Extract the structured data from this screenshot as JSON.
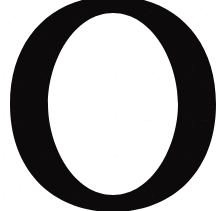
{
  "image": {
    "kind": "scanned-letterform",
    "description": "Large black serif capital letter O on white background",
    "width_px": 223,
    "height_px": 211,
    "background_color": "#ffffff",
    "ink_color": "#0c0a0a"
  },
  "glyph": {
    "character": "O",
    "name": "letter-o",
    "script": "Latin",
    "case": "uppercase",
    "style": "serif",
    "weight": "bold",
    "color": "#0c0a0a",
    "outer": {
      "center_x": 113,
      "center_y": 104,
      "radius_x": 103,
      "radius_y": 108
    },
    "counter": {
      "center_x": 113,
      "center_y": 104,
      "radius_x": 65,
      "radius_y": 91,
      "color": "#ffffff"
    },
    "stroke": {
      "left_px": 38,
      "right_px": 38,
      "top_px": 14,
      "bottom_px": 20,
      "contrast": "high-modulation thick-thin"
    },
    "extents": {
      "left_px": 10,
      "right_px": 216,
      "top_px": 0,
      "bottom_px": 207,
      "top_cropped": true
    }
  },
  "caption": "O"
}
